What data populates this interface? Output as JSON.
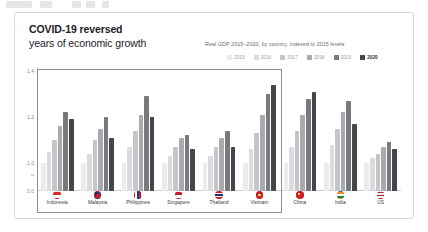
{
  "card": {
    "title_line1": "COVID-19 reversed",
    "title_line2": "years of economic growth",
    "subtitle": "Real GDP 2015–2020, by country, indexed to 2015 levels"
  },
  "legend": [
    {
      "label": "2015",
      "color": "#ececed"
    },
    {
      "label": "2016",
      "color": "#dcdcde"
    },
    {
      "label": "2017",
      "color": "#c6c6ca"
    },
    {
      "label": "2018",
      "color": "#a9a9b0"
    },
    {
      "label": "2019",
      "color": "#78787f"
    },
    {
      "label": "2020",
      "color": "#45454c"
    }
  ],
  "axis": {
    "break_symbol": "≈",
    "ticks": [
      "1.4",
      "1.2",
      "1.0",
      "0.0"
    ]
  },
  "group_box_label": "ASEAN",
  "chart_data": {
    "type": "bar",
    "title": "COVID-19 reversed years of economic growth",
    "subtitle": "Real GDP 2015–2020, by country, indexed to 2015 levels",
    "xlabel": "",
    "ylabel": "",
    "ylim": [
      0.9,
      1.45
    ],
    "grid": false,
    "legend_position": "top-right",
    "axis_break": true,
    "categories": [
      "Indonesia",
      "Malaysia",
      "Philippines",
      "Singapore",
      "Thailand",
      "Vietnam",
      "China",
      "India",
      "US"
    ],
    "series": [
      {
        "name": "2015",
        "color": "#ececed",
        "values": [
          1.0,
          1.0,
          1.0,
          1.0,
          1.0,
          1.0,
          1.0,
          1.0,
          1.0
        ]
      },
      {
        "name": "2016",
        "color": "#dcdcde",
        "values": [
          1.05,
          1.04,
          1.07,
          1.03,
          1.03,
          1.06,
          1.07,
          1.08,
          1.02
        ]
      },
      {
        "name": "2017",
        "color": "#c6c6ca",
        "values": [
          1.1,
          1.1,
          1.14,
          1.07,
          1.07,
          1.13,
          1.14,
          1.15,
          1.04
        ]
      },
      {
        "name": "2018",
        "color": "#a9a9b0",
        "values": [
          1.16,
          1.15,
          1.21,
          1.11,
          1.11,
          1.21,
          1.21,
          1.22,
          1.07
        ]
      },
      {
        "name": "2019",
        "color": "#78787f",
        "values": [
          1.22,
          1.2,
          1.29,
          1.12,
          1.14,
          1.3,
          1.28,
          1.27,
          1.09
        ]
      },
      {
        "name": "2020",
        "color": "#45454c",
        "values": [
          1.19,
          1.11,
          1.2,
          1.06,
          1.07,
          1.34,
          1.31,
          1.17,
          1.06
        ]
      }
    ],
    "groups": [
      {
        "name": "ASEAN",
        "members": [
          "Indonesia",
          "Malaysia",
          "Philippines",
          "Singapore",
          "Thailand",
          "Vietnam"
        ],
        "boxed": true
      },
      {
        "name": "Other",
        "members": [
          "China",
          "India",
          "US"
        ],
        "boxed": false
      }
    ]
  }
}
